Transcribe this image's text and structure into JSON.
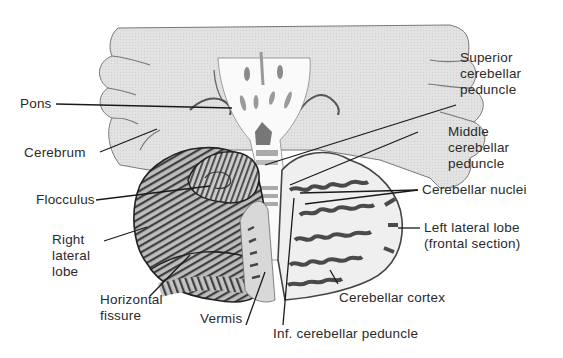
{
  "figure": {
    "colors": {
      "background": "#ffffff",
      "cerebrum_fill": "#dcdcdc",
      "outline": "#555555",
      "folia_dark": "#4a4a4a",
      "section_light": "#eeeeee",
      "label_text": "#2a2a2a",
      "leader_line": "#1a1a1a"
    },
    "labels": {
      "pons": "Pons",
      "cerebrum": "Cerebrum",
      "flocculus": "Flocculus",
      "right_lateral_lobe": "Right\nlateral\nlobe",
      "horizontal_fissure": "Horizontal\nfissure",
      "vermis": "Vermis",
      "inf_cerebellar_peduncle": "Inf. cerebellar peduncle",
      "cerebellar_cortex": "Cerebellar cortex",
      "left_lateral_lobe": "Left lateral lobe\n(frontal section)",
      "cerebellar_nuclei": "Cerebellar nuclei",
      "middle_cerebellar_peduncle": "Middle\ncerebellar\npeduncle",
      "superior_cerebellar_peduncle": "Superior\ncerebellar\npeduncle"
    }
  }
}
